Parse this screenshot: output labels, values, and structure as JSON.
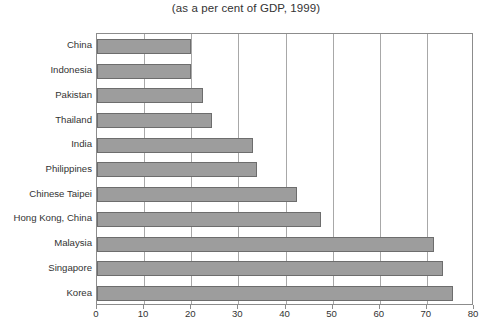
{
  "chart_data": {
    "type": "bar",
    "orientation": "horizontal",
    "title": "(as a per cent of GDP, 1999)",
    "xlabel": "",
    "ylabel": "",
    "xlim": [
      0,
      80
    ],
    "xticks": [
      0,
      10,
      20,
      30,
      40,
      50,
      60,
      70,
      80
    ],
    "grid": "vertical",
    "legend": "none",
    "bar_color": "#9d9d9d",
    "bar_border_color": "#6d6d6d",
    "categories": [
      "China",
      "Indonesia",
      "Pakistan",
      "Thailand",
      "India",
      "Philippines",
      "Chinese Taipei",
      "Hong Kong, China",
      "Malaysia",
      "Singapore",
      "Korea"
    ],
    "values": [
      20,
      20,
      22.5,
      24.5,
      33,
      34,
      42.5,
      47.5,
      71.5,
      73.5,
      75.5
    ]
  }
}
